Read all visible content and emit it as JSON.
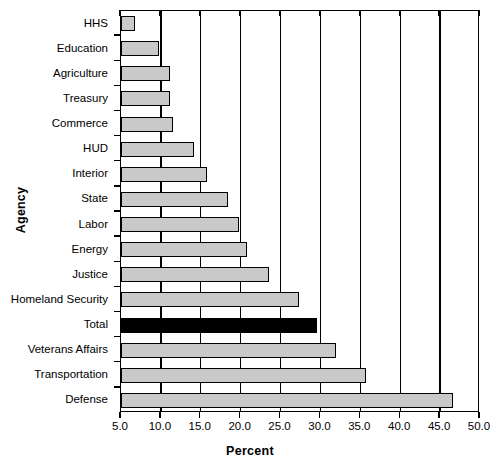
{
  "chart_data": {
    "type": "bar",
    "orientation": "horizontal",
    "title": "",
    "xlabel": "Percent",
    "ylabel": "Agency",
    "xlim": [
      5.0,
      50.0
    ],
    "xticks": [
      "5.0",
      "10.0",
      "15.0",
      "20.0",
      "25.0",
      "30.0",
      "35.0",
      "40.0",
      "45.0",
      "50.0"
    ],
    "xtick_values": [
      5,
      10,
      15,
      20,
      25,
      30,
      35,
      40,
      45,
      50
    ],
    "grid": "vertical",
    "legend": "none",
    "categories": [
      "HHS",
      "Education",
      "Agriculture",
      "Treasury",
      "Commerce",
      "HUD",
      "Interior",
      "State",
      "Labor",
      "Energy",
      "Justice",
      "Homeland Security",
      "Total",
      "Veterans Affairs",
      "Transportation",
      "Defense"
    ],
    "values": [
      6.7,
      9.8,
      11.2,
      11.2,
      11.5,
      14.2,
      15.8,
      18.4,
      19.8,
      20.8,
      23.5,
      27.3,
      29.6,
      31.9,
      35.7,
      46.6
    ],
    "highlight_category": "Total",
    "colors": {
      "bar_fill": "#c9c9c9",
      "bar_edge": "#000000",
      "highlight_fill": "#000000",
      "axis": "#000000",
      "background": "#ffffff"
    }
  }
}
